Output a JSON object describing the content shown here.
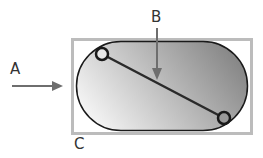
{
  "labels": {
    "a": "A",
    "b": "B",
    "c": "C"
  },
  "colors": {
    "frame": "#b8b8b8",
    "outline": "#1a1a1a",
    "arrow": "#6e6e6e",
    "fill_light": "#f4f4f4",
    "fill_dark": "#8a8a8a",
    "label": "#333333"
  }
}
